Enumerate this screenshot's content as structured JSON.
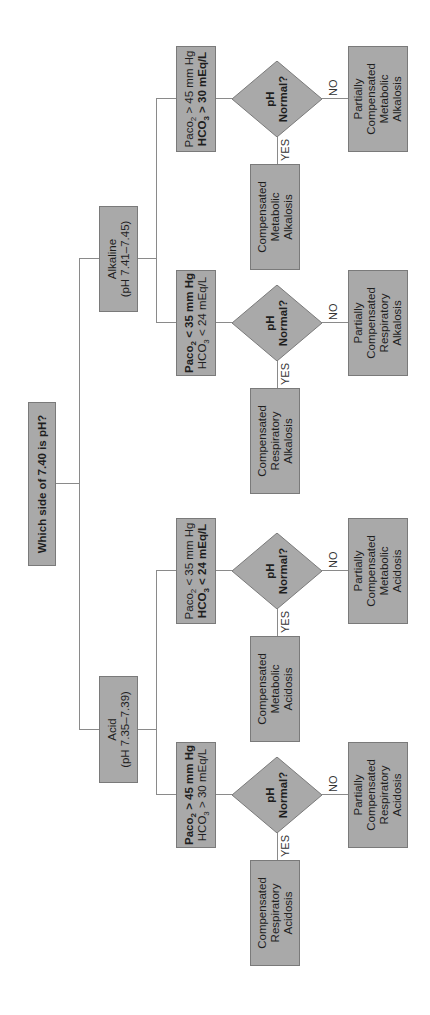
{
  "root": {
    "label": "Which side of 7.40 is pH?"
  },
  "branches": [
    {
      "id": "alkaline",
      "title": "Alkaline",
      "range": "(pH 7.41–7.45)",
      "groups": [
        {
          "paco2": "Paco",
          "paco2_sub": "2",
          "paco2_rel": " > 45 mm Hg",
          "paco2_bold": false,
          "hco3": "HCO",
          "hco3_sub": "3",
          "hco3_rel": " > 30 mEq/L",
          "hco3_bold": true,
          "question_line1": "pH",
          "question_line2": "Normal?",
          "yes_label": "YES",
          "no_label": "NO",
          "yes_result": [
            "Compensated",
            "Metabolic",
            "Alkalosis"
          ],
          "no_result": [
            "Partially",
            "Compensated",
            "Metabolic",
            "Alkalosis"
          ]
        },
        {
          "paco2": "Paco",
          "paco2_sub": "2",
          "paco2_rel": " < 35 mm Hg",
          "paco2_bold": true,
          "hco3": "HCO",
          "hco3_sub": "3",
          "hco3_rel": " < 24 mEq/L",
          "hco3_bold": false,
          "question_line1": "pH",
          "question_line2": "Normal?",
          "yes_label": "YES",
          "no_label": "NO",
          "yes_result": [
            "Compensated",
            "Respiratory",
            "Alkalosis"
          ],
          "no_result": [
            "Partially",
            "Compensated",
            "Respiratory",
            "Alkalosis"
          ]
        }
      ]
    },
    {
      "id": "acid",
      "title": "Acid",
      "range": "(pH 7.35–7.39)",
      "groups": [
        {
          "paco2": "Paco",
          "paco2_sub": "2",
          "paco2_rel": " < 35 mm Hg",
          "paco2_bold": false,
          "hco3": "HCO",
          "hco3_sub": "3",
          "hco3_rel": " < 24 mEq/L",
          "hco3_bold": true,
          "question_line1": "pH",
          "question_line2": "Normal?",
          "yes_label": "YES",
          "no_label": "NO",
          "yes_result": [
            "Compensated",
            "Metabolic",
            "Acidosis"
          ],
          "no_result": [
            "Partially",
            "Compensated",
            "Metabolic",
            "Acidosis"
          ]
        },
        {
          "paco2": "Paco",
          "paco2_sub": "2",
          "paco2_rel": " > 45 mm Hg",
          "paco2_bold": true,
          "hco3": "HCO",
          "hco3_sub": "3",
          "hco3_rel": " > 30 mEq/L",
          "hco3_bold": false,
          "question_line1": "pH",
          "question_line2": "Normal?",
          "yes_label": "YES",
          "no_label": "NO",
          "yes_result": [
            "Compensated",
            "Respiratory",
            "Acidosis"
          ],
          "no_result": [
            "Partially",
            "Compensated",
            "Respiratory",
            "Acidosis"
          ]
        }
      ]
    }
  ],
  "colors": {
    "box_fill": "#a9a9a9",
    "box_border": "#7a7a7a",
    "line": "#8a8a8a",
    "text": "#1e1e1e"
  }
}
